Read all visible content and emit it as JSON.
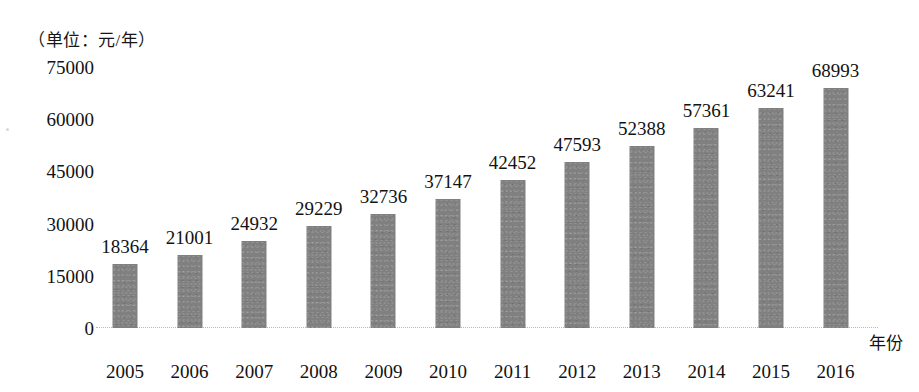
{
  "chart_data": {
    "type": "bar",
    "title": "",
    "subtitle": "",
    "unit_caption": "（单位：元/年）",
    "xlabel": "年份",
    "ylabel": "",
    "categories": [
      "2005",
      "2006",
      "2007",
      "2008",
      "2009",
      "2010",
      "2011",
      "2012",
      "2013",
      "2014",
      "2015",
      "2016"
    ],
    "values": [
      18364,
      21001,
      24932,
      29229,
      32736,
      37147,
      42452,
      47593,
      52388,
      57361,
      63241,
      68993
    ],
    "data_labels": [
      "18364",
      "21001",
      "24932",
      "29229",
      "32736",
      "37147",
      "42452",
      "47593",
      "52388",
      "57361",
      "63241",
      "68993"
    ],
    "ylim": [
      0,
      75000
    ],
    "yticks": [
      0,
      15000,
      30000,
      45000,
      60000,
      75000
    ],
    "ytick_labels": [
      "0",
      "15000",
      "30000",
      "45000",
      "60000",
      "75000"
    ],
    "grid": false,
    "legend": false,
    "legend_position": "none",
    "series": [
      {
        "name": "",
        "values": [
          18364,
          21001,
          24932,
          29229,
          32736,
          37147,
          42452,
          47593,
          52388,
          57361,
          63241,
          68993
        ]
      }
    ],
    "colors": {
      "bar_fill": "#808080",
      "text": "#121212",
      "baseline": "#b8b8b8",
      "background": "#ffffff"
    }
  }
}
